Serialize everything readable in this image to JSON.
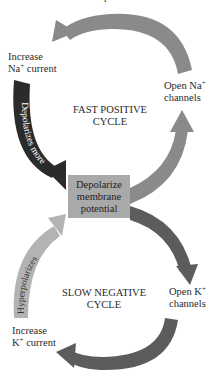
{
  "diagram": {
    "top_fragment": "p",
    "fast_cycle": {
      "title_line1": "FAST POSITIVE",
      "title_line2": "CYCLE"
    },
    "slow_cycle": {
      "title_line1": "SLOW NEGATIVE",
      "title_line2": "CYCLE"
    },
    "center_box": {
      "line1": "Depolarize",
      "line2": "membrane",
      "line3": "potential",
      "color": "#a9a9a9"
    },
    "labels": {
      "increase_na_line1": "Increase",
      "increase_na_ion": "Na",
      "increase_na_charge": "+",
      "increase_na_rest": " current",
      "open_na_line1_text": "Open Na",
      "open_na_charge": "+",
      "open_na_line2": "channels",
      "open_k_line1_text": "Open K",
      "open_k_charge": "+",
      "open_k_line2": "channels",
      "increase_k_line1": "Increase",
      "increase_k_ion": "K",
      "increase_k_charge": "+",
      "increase_k_rest": " current"
    },
    "arrow_labels": {
      "depolarizes_more": "Depolarizes more",
      "hyperpolarizes": "Hyperpolarizes"
    },
    "colors": {
      "fast_arrow": "#8a8a8a",
      "depolarize_arrow": "#2b2b2b",
      "slow_arrow": "#5c5c5c",
      "hyperpolarize_arrow": "#b3b3b3"
    }
  }
}
